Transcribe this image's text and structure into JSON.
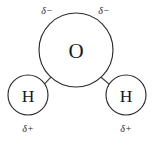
{
  "figure": {
    "background_color": "#ffffff",
    "outline_color": "#2b2b2b",
    "text_color": "#1a1a1a"
  },
  "atoms": {
    "oxygen": {
      "label": "O",
      "element_name": "oxygen",
      "center_x": 76,
      "center_y": 50,
      "radius": 37
    },
    "hydrogen_left": {
      "label": "H",
      "element_name": "hydrogen",
      "center_x": 28,
      "center_y": 95,
      "radius": 20
    },
    "hydrogen_right": {
      "label": "H",
      "element_name": "hydrogen",
      "center_x": 126,
      "center_y": 95,
      "radius": 20
    }
  },
  "bonds": [
    {
      "name": "oxygen-hydrogen-left-bond",
      "x1": 50.9,
      "y1": 77.2,
      "x2": 42.0,
      "y2": 86.6
    },
    {
      "name": "oxygen-hydrogen-right-bond",
      "x1": 101.1,
      "y1": 77.2,
      "x2": 112.0,
      "y2": 86.6
    }
  ],
  "charge_labels": {
    "top_left": {
      "text": "δ−",
      "name": "partial-negative-charge-left",
      "x": 47,
      "y": 14
    },
    "top_right": {
      "text": "δ−",
      "name": "partial-negative-charge-right",
      "x": 104,
      "y": 14
    },
    "bottom_left": {
      "text": "δ+",
      "name": "partial-positive-charge-left",
      "x": 28,
      "y": 132
    },
    "bottom_right": {
      "text": "δ+",
      "name": "partial-positive-charge-right",
      "x": 126,
      "y": 132
    }
  }
}
